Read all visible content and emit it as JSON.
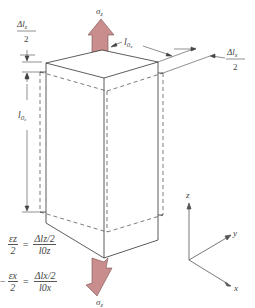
{
  "figure": {
    "type": "uniaxial-tension-strain-diagram",
    "stress_top_label": "σz",
    "stress_bottom_label": "σz",
    "arrow_color": "#c98d8d",
    "arrow_stroke": "#7a5050",
    "dim_top_left": {
      "num": "Δlz",
      "den": "2"
    },
    "dim_top_right": {
      "num": "Δlx",
      "den": "2"
    },
    "dim_l0x": "l0x",
    "dim_l0z": "l0z",
    "axes": {
      "z": "z",
      "y": "y",
      "x": "x"
    }
  },
  "equations": [
    {
      "lhs_sign": "",
      "lhs_num": "εz",
      "lhs_den": "2",
      "op": "=",
      "rhs_num": "Δlz/2",
      "rhs_den": "l0z"
    },
    {
      "lhs_sign": "−",
      "lhs_num": "εx",
      "lhs_den": "2",
      "op": "=",
      "rhs_num": "Δlx/2",
      "rhs_den": "l0x"
    }
  ]
}
